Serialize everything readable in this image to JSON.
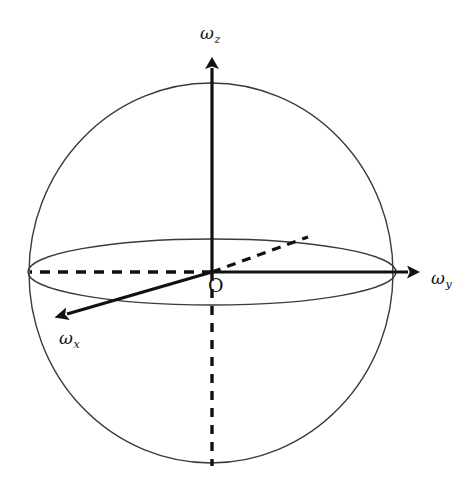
{
  "figure": {
    "background_color": "#ffffff",
    "stroke_color": "#1a1a1a",
    "sphere_outline_color": "#333333"
  },
  "labels": {
    "omega_symbol": "ω",
    "z_axis": {
      "symbol": "ω",
      "subscript": "z"
    },
    "y_axis": {
      "symbol": "ω",
      "subscript": "y"
    },
    "x_axis": {
      "symbol": "ω",
      "subscript": "x"
    },
    "origin": "O"
  },
  "geometry": {
    "sphere": {
      "cx": 211,
      "cy": 273,
      "rx": 182,
      "ry": 190
    },
    "equator_ellipse": {
      "cx": 212,
      "cy": 272,
      "rx": 184,
      "ry": 33
    },
    "origin_point": {
      "x": 212,
      "y": 272
    },
    "z_axis_positive": {
      "from": [
        212,
        272
      ],
      "to": [
        212,
        52
      ],
      "style": "solid",
      "arrow": true
    },
    "z_axis_negative": {
      "from": [
        212,
        272
      ],
      "to": [
        212,
        466
      ],
      "style": "dashed",
      "arrow": false
    },
    "y_axis_positive": {
      "from": [
        212,
        272
      ],
      "to": [
        422,
        272
      ],
      "style": "solid",
      "arrow": true
    },
    "y_axis_negative": {
      "from": [
        212,
        272
      ],
      "to": [
        29,
        272
      ],
      "style": "dashed",
      "arrow": false
    },
    "x_axis_positive": {
      "from": [
        212,
        272
      ],
      "to": [
        53,
        318
      ],
      "style": "solid",
      "arrow": true
    },
    "x_axis_negative": {
      "from": [
        212,
        272
      ],
      "to": [
        308,
        237
      ],
      "style": "dashed",
      "arrow": false
    }
  }
}
